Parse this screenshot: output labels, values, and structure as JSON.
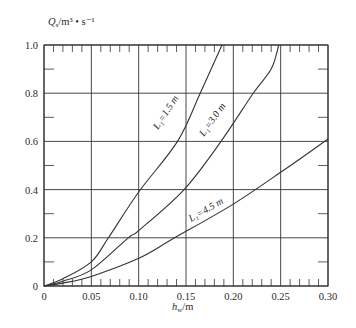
{
  "chart_data": {
    "type": "line",
    "title": "",
    "xlabel": "h_w/m",
    "ylabel": "Q_s/m³·s⁻¹",
    "xlim": [
      0,
      0.3
    ],
    "ylim": [
      0,
      1.0
    ],
    "grid": true,
    "legend": "inline curve labels",
    "x_ticks": [
      "0",
      "0.05",
      "0.10",
      "0.15",
      "0.20",
      "0.25",
      "0.30"
    ],
    "y_ticks": [
      "0",
      "0.2",
      "0.4",
      "0.6",
      "0.8",
      "1.0"
    ],
    "series": [
      {
        "name": "L₁=1.5 m",
        "x": [
          0,
          0.02,
          0.05,
          0.068,
          0.1,
          0.141,
          0.165,
          0.188
        ],
        "y": [
          0,
          0.03,
          0.1,
          0.2,
          0.39,
          0.6,
          0.8,
          1.0
        ]
      },
      {
        "name": "L₁=3.0 m",
        "x": [
          0,
          0.02,
          0.05,
          0.089,
          0.1,
          0.148,
          0.187,
          0.221,
          0.24,
          0.248
        ],
        "y": [
          0,
          0.02,
          0.067,
          0.2,
          0.23,
          0.4,
          0.6,
          0.8,
          0.9,
          1.0
        ]
      },
      {
        "name": "L₁=4.5 m",
        "x": [
          0,
          0.02,
          0.05,
          0.1,
          0.138,
          0.2,
          0.253,
          0.3
        ],
        "y": [
          0,
          0.012,
          0.04,
          0.115,
          0.2,
          0.34,
          0.48,
          0.61
        ]
      }
    ]
  },
  "labels": {
    "y_axis_title_main": "Q",
    "y_axis_title_sub": "s",
    "y_axis_title_rest": "/m³ • s⁻¹",
    "x_axis_title_main": "h",
    "x_axis_title_sub": "w",
    "x_axis_title_rest": "/m",
    "curve_1": "L₁=1.5 m",
    "curve_2": "L₁=3.0 m",
    "curve_3": "L₁=4.5 m"
  },
  "style": {
    "line_color": "#333333",
    "grid_color": "#333333",
    "background": "#ffffff"
  }
}
